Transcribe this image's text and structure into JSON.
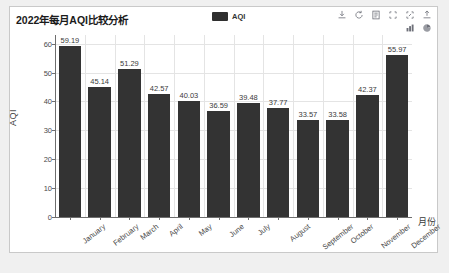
{
  "panel": {
    "title": "2022年每月AQI比较分析",
    "background_color": "#ffffff",
    "border_color": "#c9c9c9",
    "page_background_color": "#f0f0f0"
  },
  "legend": {
    "position": "top-center",
    "items": [
      {
        "label": "AQI",
        "color": "#2f2f2f"
      }
    ]
  },
  "toolbox": {
    "rows": [
      [
        {
          "name": "download-icon",
          "title": "保存为图片"
        },
        {
          "name": "refresh-icon",
          "title": "还原"
        },
        {
          "name": "data-view-icon",
          "title": "数据视图"
        },
        {
          "name": "zoom-select-icon",
          "title": "区域缩放"
        },
        {
          "name": "zoom-reset-icon",
          "title": "区域缩放还原"
        },
        {
          "name": "export-icon",
          "title": "导出"
        }
      ],
      [
        {
          "name": "bar-chart-icon",
          "title": "切换为柱状图"
        },
        {
          "name": "pie-chart-icon",
          "title": "切换为饼图"
        }
      ]
    ]
  },
  "chart_data": {
    "type": "bar",
    "title": "2022年每月AQI比较分析",
    "xlabel": "月份",
    "ylabel": "AQI",
    "categories": [
      "January",
      "February",
      "March",
      "April",
      "May",
      "June",
      "July",
      "August",
      "September",
      "October",
      "November",
      "December"
    ],
    "values": [
      59.19,
      45.14,
      51.29,
      42.57,
      40.03,
      36.59,
      39.48,
      37.77,
      33.57,
      33.58,
      42.37,
      55.97
    ],
    "series": [
      {
        "name": "AQI",
        "color": "#333333",
        "values": [
          59.19,
          45.14,
          51.29,
          42.57,
          40.03,
          36.59,
          39.48,
          37.77,
          33.57,
          33.58,
          42.37,
          55.97
        ]
      }
    ],
    "data_labels": [
      "59.19",
      "45.14",
      "51.29",
      "42.57",
      "40.03",
      "36.59",
      "39.48",
      "37.77",
      "33.57",
      "33.58",
      "42.37",
      "55.97"
    ],
    "yticks": [
      0,
      10,
      20,
      30,
      40,
      50,
      60
    ],
    "ytick_labels": [
      "0",
      "10",
      "20",
      "30",
      "40",
      "50",
      "60"
    ],
    "ylim": [
      0,
      63
    ],
    "grid": true,
    "grid_color": "#e4e4e4",
    "legend_position": "top",
    "bar_color": "#333333",
    "label_rotation_deg": -38
  }
}
